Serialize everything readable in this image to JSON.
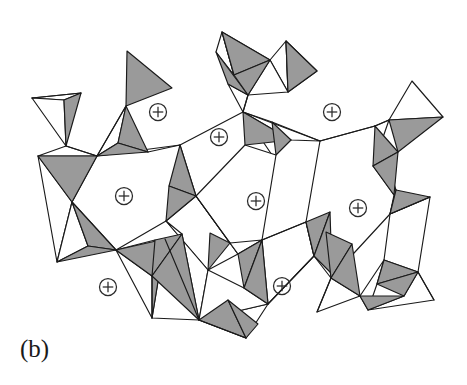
{
  "figure": {
    "panel_label": "(b)",
    "caption_text": "",
    "background_color": "#ffffff",
    "outline_color": "#1a1a1a",
    "shaded_face_color": "#9a9a9a",
    "light_face_color": "#ffffff",
    "cation_symbol": "plus-in-circle",
    "cation_color": "#2b2b2b",
    "diagram_type": "polyhedral-framework"
  },
  "chart_data": {
    "type": "diagram",
    "title": "",
    "subtitle": "",
    "xlabel": "",
    "ylabel": "",
    "legend": [],
    "grid": false,
    "cation_sites": [
      {
        "id": "cation-1",
        "cx": 158,
        "cy": 112,
        "r": 8.5
      },
      {
        "id": "cation-2",
        "cx": 219,
        "cy": 137,
        "r": 8.5
      },
      {
        "id": "cation-3",
        "cx": 332,
        "cy": 112,
        "r": 8.5
      },
      {
        "id": "cation-4",
        "cx": 124,
        "cy": 196,
        "r": 8.5
      },
      {
        "id": "cation-5",
        "cx": 256,
        "cy": 201,
        "r": 8.5
      },
      {
        "id": "cation-6",
        "cx": 358,
        "cy": 208,
        "r": 8.5
      },
      {
        "id": "cation-7",
        "cx": 108,
        "cy": 287,
        "r": 8.5
      },
      {
        "id": "cation-8",
        "cx": 282,
        "cy": 286,
        "r": 8.5
      }
    ],
    "shaded_faces": [
      {
        "id": "sf-01",
        "points": "64,100 81,93 66,146"
      },
      {
        "id": "sf-02",
        "points": "127,51 172,88 126,106"
      },
      {
        "id": "sf-03",
        "points": "126,106 148,152 118,143"
      },
      {
        "id": "sf-04",
        "points": "118,143 148,152 97,156"
      },
      {
        "id": "sf-05",
        "points": "38,156 97,156 72,202"
      },
      {
        "id": "sf-06",
        "points": "72,202 116,250 88,246"
      },
      {
        "id": "sf-07",
        "points": "88,246 116,250 57,262"
      },
      {
        "id": "sf-08",
        "points": "116,250 165,239 152,276"
      },
      {
        "id": "sf-09",
        "points": "152,276 165,239 152,318"
      },
      {
        "id": "sf-10",
        "points": "180,145 196,196 169,186"
      },
      {
        "id": "sf-11",
        "points": "169,186 196,196 166,221"
      },
      {
        "id": "sf-12",
        "points": "155,240 182,234 152,276"
      },
      {
        "id": "sf-13",
        "points": "152,276 182,234 199,320"
      },
      {
        "id": "sf-14",
        "points": "199,320 228,300 246,338"
      },
      {
        "id": "sf-15",
        "points": "222,32 270,60 234,75"
      },
      {
        "id": "sf-16",
        "points": "216,52 248,95 228,84"
      },
      {
        "id": "sf-17",
        "points": "234,75 270,60 248,95"
      },
      {
        "id": "sf-18",
        "points": "286,41 317,71 288,92"
      },
      {
        "id": "sf-19",
        "points": "243,112 291,140 245,145"
      },
      {
        "id": "sf-20",
        "points": "272,122 291,140 276,155"
      },
      {
        "id": "sf-21",
        "points": "210,233 230,243 208,270"
      },
      {
        "id": "sf-22",
        "points": "238,254 262,240 244,288"
      },
      {
        "id": "sf-23",
        "points": "244,288 262,240 268,304"
      },
      {
        "id": "sf-24",
        "points": "246,338 228,300 258,324"
      },
      {
        "id": "sf-25",
        "points": "306,222 330,212 314,256"
      },
      {
        "id": "sf-26",
        "points": "314,256 330,212 332,274"
      },
      {
        "id": "sf-27",
        "points": "389,120 443,117 398,152"
      },
      {
        "id": "sf-28",
        "points": "375,126 398,152 373,166"
      },
      {
        "id": "sf-29",
        "points": "373,166 398,152 394,195"
      },
      {
        "id": "sf-30",
        "points": "396,190 430,197 390,214"
      },
      {
        "id": "sf-31",
        "points": "326,232 352,244 331,278"
      },
      {
        "id": "sf-32",
        "points": "331,278 352,244 360,296"
      },
      {
        "id": "sf-33",
        "points": "384,260 418,272 377,284"
      },
      {
        "id": "sf-34",
        "points": "377,284 418,272 404,296"
      },
      {
        "id": "sf-35",
        "points": "360,296 404,296 368,310"
      }
    ],
    "light_faces": [
      {
        "id": "lf-01",
        "points": "32,98 81,93 64,100"
      },
      {
        "id": "lf-02",
        "points": "32,98 64,100 66,146"
      },
      {
        "id": "lf-03",
        "points": "97,156 126,106 118,143"
      },
      {
        "id": "lf-04",
        "points": "66,146 97,156 38,156"
      },
      {
        "id": "lf-05",
        "points": "38,156 72,202 57,262"
      },
      {
        "id": "lf-06",
        "points": "72,202 88,246 57,262"
      },
      {
        "id": "lf-07",
        "points": "97,156 180,145 196,196 166,221 116,250 72,202"
      },
      {
        "id": "lf-08",
        "points": "116,250 155,240 152,276"
      },
      {
        "id": "lf-09",
        "points": "152,318 165,239 199,320"
      },
      {
        "id": "lf-10",
        "points": "196,196 238,254 208,270 166,221"
      },
      {
        "id": "lf-11",
        "points": "166,221 208,270 199,320 182,234"
      },
      {
        "id": "lf-12",
        "points": "199,320 268,304 246,338"
      },
      {
        "id": "lf-13",
        "points": "208,270 244,288 268,304 199,320"
      },
      {
        "id": "lf-14",
        "points": "216,52 222,32 234,75"
      },
      {
        "id": "lf-15",
        "points": "222,32 270,60 234,75"
      },
      {
        "id": "lf-16",
        "points": "228,84 248,95 243,112"
      },
      {
        "id": "lf-17",
        "points": "270,60 286,41 288,92"
      },
      {
        "id": "lf-18",
        "points": "270,60 288,92 248,95"
      },
      {
        "id": "lf-19",
        "points": "286,41 317,71 288,92"
      },
      {
        "id": "lf-20",
        "points": "243,112 291,140 320,141 272,122"
      },
      {
        "id": "lf-21",
        "points": "180,145 243,112 272,155 230,243 196,196"
      },
      {
        "id": "lf-22",
        "points": "245,145 276,155 262,240 238,254 196,196"
      },
      {
        "id": "lf-23",
        "points": "262,240 306,222 314,256 268,304"
      },
      {
        "id": "lf-24",
        "points": "230,243 262,240 238,254"
      },
      {
        "id": "lf-25",
        "points": "412,81 389,120 443,117"
      },
      {
        "id": "lf-26",
        "points": "375,126 389,120 373,166"
      },
      {
        "id": "lf-27",
        "points": "320,141 375,126 396,190 390,214 331,278 314,256 306,222"
      },
      {
        "id": "lf-28",
        "points": "373,166 394,195 390,214 396,190"
      },
      {
        "id": "lf-29",
        "points": "390,214 430,197 418,272 384,260"
      },
      {
        "id": "lf-30",
        "points": "326,232 360,296 331,278"
      },
      {
        "id": "lf-31",
        "points": "331,278 360,296 317,312"
      },
      {
        "id": "lf-32",
        "points": "384,260 377,284 368,310 360,296"
      },
      {
        "id": "lf-33",
        "points": "404,296 418,272 434,300 368,310"
      }
    ],
    "extra_edges": [
      {
        "id": "ee-01",
        "d": "M 32,98 L 81,93"
      },
      {
        "id": "ee-02",
        "d": "M 66,146 L 97,156"
      },
      {
        "id": "ee-03",
        "d": "M 126,106 L 97,156"
      },
      {
        "id": "ee-04",
        "d": "M 148,152 L 180,145"
      },
      {
        "id": "ee-05",
        "d": "M 116,250 L 152,318"
      },
      {
        "id": "ee-06",
        "d": "M 165,239 L 199,320"
      },
      {
        "id": "ee-07",
        "d": "M 196,196 L 230,243"
      },
      {
        "id": "ee-08",
        "d": "M 243,112 L 320,141"
      },
      {
        "id": "ee-09",
        "d": "M 248,95 L 243,112"
      },
      {
        "id": "ee-10",
        "d": "M 320,141 L 375,126"
      },
      {
        "id": "ee-11",
        "d": "M 389,120 L 375,126"
      },
      {
        "id": "ee-12",
        "d": "M 262,240 L 306,222"
      },
      {
        "id": "ee-13",
        "d": "M 268,304 L 314,256"
      },
      {
        "id": "ee-14",
        "d": "M 331,278 L 317,312"
      },
      {
        "id": "ee-15",
        "d": "M 390,214 L 430,197"
      },
      {
        "id": "ee-16",
        "d": "M 418,272 L 434,300"
      },
      {
        "id": "ee-17",
        "d": "M 152,276 L 152,318"
      },
      {
        "id": "ee-18",
        "d": "M 199,320 L 246,338"
      }
    ]
  }
}
